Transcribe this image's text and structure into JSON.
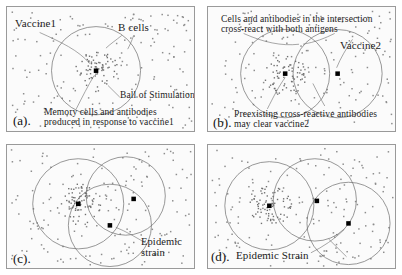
{
  "figure": {
    "panel_count": 4,
    "colors": {
      "panel_background": "#fbfbfb",
      "panel_border": "#9a9a9a",
      "dot": "#8d8d8d",
      "cluster_dot": "#6f6f6f",
      "circle_stroke": "#6b6b6b",
      "marker": "#000000",
      "text": "#1b1b1b"
    },
    "marker_legend": {
      "small_square_dot": "B cells",
      "solid_black_square": "antigen / vaccine strain center",
      "dense_dot_cluster": "memory cells and antibodies",
      "open_circle": "ball of stimulation"
    }
  },
  "panels": [
    {
      "id": "a",
      "tag": "(a).",
      "labels": [
        {
          "name": "vaccine1",
          "text": "Vaccine1"
        },
        {
          "name": "b-cells",
          "text": "B cells"
        },
        {
          "name": "ball-of-stimulation",
          "text": "Ball of Stimulation"
        },
        {
          "name": "memory-cells-caption-line1",
          "text": "Memory cells and antibodies"
        },
        {
          "name": "memory-cells-caption-line2",
          "text": "produced in response to vaccine1"
        }
      ],
      "circles": [
        {
          "name": "ball-of-stimulation-vaccine1",
          "cx": 90,
          "cy": 65,
          "r": 45
        }
      ],
      "markers": [
        {
          "name": "vaccine1-center",
          "cx": 90,
          "cy": 65
        }
      ],
      "clusters": [
        {
          "name": "memory-cell-cluster-vaccine1",
          "cx": 90,
          "cy": 65,
          "spread": 22,
          "count": 70
        }
      ]
    },
    {
      "id": "b",
      "tag": "(b).",
      "labels": [
        {
          "name": "intersection-caption-line1",
          "text": "Cells and antibodies in the intersection"
        },
        {
          "name": "intersection-caption-line2",
          "text": "cross-react with both antigens"
        },
        {
          "name": "vaccine2",
          "text": "Vaccine2"
        },
        {
          "name": "preexisting-caption-line1",
          "text": "Preexisting cross-reactive antibodies"
        },
        {
          "name": "preexisting-caption-line2",
          "text": "may clear vaccine2"
        }
      ],
      "circles": [
        {
          "name": "ball-of-stimulation-vaccine1",
          "cx": 78,
          "cy": 68,
          "r": 45
        },
        {
          "name": "ball-of-stimulation-vaccine2",
          "cx": 131,
          "cy": 68,
          "r": 45
        }
      ],
      "markers": [
        {
          "name": "vaccine1-center",
          "cx": 78,
          "cy": 68
        },
        {
          "name": "vaccine2-center",
          "cx": 131,
          "cy": 68
        }
      ],
      "clusters": [
        {
          "name": "memory-cell-cluster-vaccine1",
          "cx": 78,
          "cy": 68,
          "spread": 22,
          "count": 70
        }
      ]
    },
    {
      "id": "c",
      "tag": "(c).",
      "labels": [
        {
          "name": "epidemic-strain-line1",
          "text": "Epidemic"
        },
        {
          "name": "epidemic-strain-line2",
          "text": "strain"
        }
      ],
      "circles": [
        {
          "name": "ball-of-stimulation-vaccine1",
          "cx": 72,
          "cy": 60,
          "r": 46
        },
        {
          "name": "ball-of-stimulation-vaccine2",
          "cx": 120,
          "cy": 52,
          "r": 40
        },
        {
          "name": "ball-of-stimulation-epidemic",
          "cx": 104,
          "cy": 82,
          "r": 42
        }
      ],
      "markers": [
        {
          "name": "vaccine1-center",
          "cx": 72,
          "cy": 60
        },
        {
          "name": "vaccine2-center",
          "cx": 128,
          "cy": 55
        },
        {
          "name": "epidemic-strain-center",
          "cx": 104,
          "cy": 82
        }
      ],
      "clusters": [
        {
          "name": "memory-cell-cluster-vaccine1",
          "cx": 72,
          "cy": 60,
          "spread": 22,
          "count": 70
        }
      ]
    },
    {
      "id": "d",
      "tag": "(d).",
      "labels": [
        {
          "name": "epidemic-strain",
          "text": "Epidemic Strain"
        }
      ],
      "circles": [
        {
          "name": "ball-of-stimulation-vaccine1",
          "cx": 62,
          "cy": 62,
          "r": 45
        },
        {
          "name": "ball-of-stimulation-vaccine2",
          "cx": 108,
          "cy": 56,
          "r": 42
        },
        {
          "name": "ball-of-stimulation-epidemic",
          "cx": 142,
          "cy": 80,
          "r": 42
        }
      ],
      "markers": [
        {
          "name": "vaccine1-center",
          "cx": 62,
          "cy": 62
        },
        {
          "name": "vaccine2-center",
          "cx": 110,
          "cy": 57
        },
        {
          "name": "epidemic-strain-center",
          "cx": 142,
          "cy": 80
        }
      ],
      "clusters": [
        {
          "name": "memory-cell-cluster-vaccine1",
          "cx": 62,
          "cy": 62,
          "spread": 22,
          "count": 70
        }
      ]
    }
  ]
}
